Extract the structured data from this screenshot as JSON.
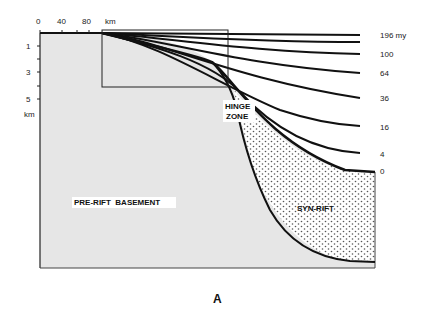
{
  "figure": {
    "panel_label": "A",
    "x_axis": {
      "ticks": [
        "0",
        "40",
        "80"
      ],
      "unit": "km"
    },
    "y_axis": {
      "ticks": [
        "1",
        "3",
        "5"
      ],
      "unit": "km"
    },
    "regions": {
      "basement": "PRE-RIFT  BASEMENT",
      "synrift": "SYN-RIFT",
      "hinge_line1": "HINGE",
      "hinge_line2": "ZONE"
    },
    "isochrons": [
      {
        "label": "196 my",
        "age": 196
      },
      {
        "label": "",
        "age": 150
      },
      {
        "label": "100",
        "age": 100
      },
      {
        "label": "64",
        "age": 64
      },
      {
        "label": "36",
        "age": 36
      },
      {
        "label": "16",
        "age": 16
      },
      {
        "label": "4",
        "age": 4
      },
      {
        "label": "0",
        "age": 0
      }
    ],
    "colors": {
      "basement_fill": "#e6e6e6",
      "line": "#111111",
      "stipple": "#555555"
    }
  }
}
